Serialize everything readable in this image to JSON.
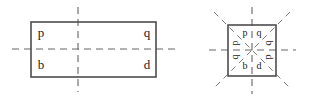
{
  "figure": {
    "background_color": "#ffffff",
    "outline_color": "#4d4d4d",
    "axis_color": "#666666",
    "diagonal_axis_color": "#7a7a7a",
    "letter_color": "#1a1a1a",
    "left_shape": {
      "name": "rectangle",
      "label": "rectangle with two mirror lines",
      "letters": {
        "top_left": "p",
        "top_right": "q",
        "bottom_left": "b",
        "bottom_right": "d"
      },
      "axes": [
        "vertical",
        "horizontal"
      ]
    },
    "right_shape": {
      "name": "square",
      "label": "square with four mirror lines",
      "letters": {
        "top_left": "p",
        "top_right": "q",
        "bottom_left": "b",
        "bottom_right": "d",
        "left_upper": "p",
        "left_lower": "q",
        "right_upper": "b",
        "right_lower": "d"
      },
      "axes": [
        "vertical",
        "horizontal",
        "diagonal-nwse",
        "diagonal-nesw"
      ]
    }
  }
}
